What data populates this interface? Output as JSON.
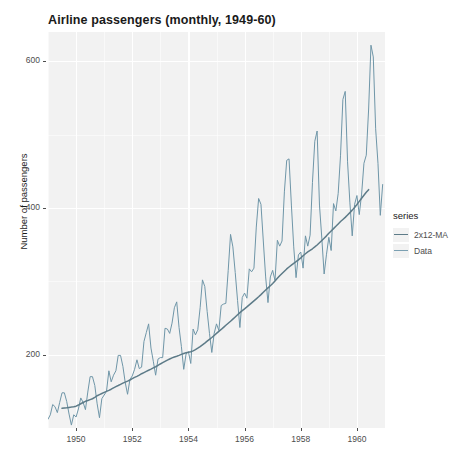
{
  "chart_data": {
    "type": "line",
    "title": "Airline passengers (monthly, 1949-60)",
    "xlabel": "",
    "ylabel": "Number of passengers",
    "xlim": [
      1949.0,
      1961.0
    ],
    "ylim": [
      100,
      640
    ],
    "xticks": [
      1950,
      1952,
      1954,
      1956,
      1958,
      1960
    ],
    "xticklabels": [
      "1950",
      "1952",
      "1954",
      "1956",
      "1958",
      "1960"
    ],
    "yticks": [
      200,
      400,
      600
    ],
    "yticklabels": [
      "200",
      "400",
      "600"
    ],
    "grid": true,
    "legend_title": "series",
    "legend_position": "right",
    "panel_background": "#f2f2f2",
    "grid_color": "#ffffff",
    "series": [
      {
        "name": "Data",
        "color": "#6f96a8",
        "x": [
          1949.0,
          1949.083,
          1949.167,
          1949.25,
          1949.333,
          1949.417,
          1949.5,
          1949.583,
          1949.667,
          1949.75,
          1949.833,
          1949.917,
          1950.0,
          1950.083,
          1950.167,
          1950.25,
          1950.333,
          1950.417,
          1950.5,
          1950.583,
          1950.667,
          1950.75,
          1950.833,
          1950.917,
          1951.0,
          1951.083,
          1951.167,
          1951.25,
          1951.333,
          1951.417,
          1951.5,
          1951.583,
          1951.667,
          1951.75,
          1951.833,
          1951.917,
          1952.0,
          1952.083,
          1952.167,
          1952.25,
          1952.333,
          1952.417,
          1952.5,
          1952.583,
          1952.667,
          1952.75,
          1952.833,
          1952.917,
          1953.0,
          1953.083,
          1953.167,
          1953.25,
          1953.333,
          1953.417,
          1953.5,
          1953.583,
          1953.667,
          1953.75,
          1953.833,
          1953.917,
          1954.0,
          1954.083,
          1954.167,
          1954.25,
          1954.333,
          1954.417,
          1954.5,
          1954.583,
          1954.667,
          1954.75,
          1954.833,
          1954.917,
          1955.0,
          1955.083,
          1955.167,
          1955.25,
          1955.333,
          1955.417,
          1955.5,
          1955.583,
          1955.667,
          1955.75,
          1955.833,
          1955.917,
          1956.0,
          1956.083,
          1956.167,
          1956.25,
          1956.333,
          1956.417,
          1956.5,
          1956.583,
          1956.667,
          1956.75,
          1956.833,
          1956.917,
          1957.0,
          1957.083,
          1957.167,
          1957.25,
          1957.333,
          1957.417,
          1957.5,
          1957.583,
          1957.667,
          1957.75,
          1957.833,
          1957.917,
          1958.0,
          1958.083,
          1958.167,
          1958.25,
          1958.333,
          1958.417,
          1958.5,
          1958.583,
          1958.667,
          1958.75,
          1958.833,
          1958.917,
          1959.0,
          1959.083,
          1959.167,
          1959.25,
          1959.333,
          1959.417,
          1959.5,
          1959.583,
          1959.667,
          1959.75,
          1959.833,
          1959.917,
          1960.0,
          1960.083,
          1960.167,
          1960.25,
          1960.333,
          1960.417,
          1960.5,
          1960.583,
          1960.667,
          1960.75,
          1960.833,
          1960.917
        ],
        "values": [
          112,
          118,
          132,
          129,
          121,
          135,
          148,
          148,
          136,
          119,
          104,
          118,
          115,
          126,
          141,
          135,
          125,
          149,
          170,
          170,
          158,
          133,
          114,
          140,
          145,
          150,
          178,
          163,
          172,
          178,
          199,
          199,
          184,
          162,
          146,
          166,
          171,
          180,
          193,
          181,
          183,
          218,
          230,
          242,
          209,
          191,
          172,
          194,
          196,
          196,
          236,
          235,
          229,
          243,
          264,
          272,
          237,
          211,
          180,
          201,
          204,
          188,
          235,
          227,
          234,
          264,
          302,
          293,
          259,
          229,
          203,
          229,
          242,
          233,
          267,
          269,
          270,
          315,
          364,
          347,
          312,
          274,
          237,
          278,
          284,
          277,
          317,
          313,
          318,
          374,
          413,
          405,
          355,
          306,
          271,
          306,
          315,
          301,
          356,
          348,
          355,
          422,
          465,
          467,
          404,
          347,
          305,
          336,
          340,
          318,
          362,
          348,
          363,
          435,
          491,
          505,
          404,
          359,
          310,
          337,
          360,
          342,
          406,
          396,
          420,
          472,
          548,
          559,
          463,
          407,
          362,
          405,
          417,
          391,
          419,
          461,
          472,
          535,
          622,
          606,
          508,
          461,
          390,
          432
        ]
      },
      {
        "name": "2x12-MA",
        "color": "#5d7b88",
        "x": [
          1949.5,
          1949.583,
          1949.667,
          1949.75,
          1949.833,
          1949.917,
          1950.0,
          1950.083,
          1950.167,
          1950.25,
          1950.333,
          1950.417,
          1950.5,
          1950.583,
          1950.667,
          1950.75,
          1950.833,
          1950.917,
          1951.0,
          1951.083,
          1951.167,
          1951.25,
          1951.333,
          1951.417,
          1951.5,
          1951.583,
          1951.667,
          1951.75,
          1951.833,
          1951.917,
          1952.0,
          1952.083,
          1952.167,
          1952.25,
          1952.333,
          1952.417,
          1952.5,
          1952.583,
          1952.667,
          1952.75,
          1952.833,
          1952.917,
          1953.0,
          1953.083,
          1953.167,
          1953.25,
          1953.333,
          1953.417,
          1953.5,
          1953.583,
          1953.667,
          1953.75,
          1953.833,
          1953.917,
          1954.0,
          1954.083,
          1954.167,
          1954.25,
          1954.333,
          1954.417,
          1954.5,
          1954.583,
          1954.667,
          1954.75,
          1954.833,
          1954.917,
          1955.0,
          1955.083,
          1955.167,
          1955.25,
          1955.333,
          1955.417,
          1955.5,
          1955.583,
          1955.667,
          1955.75,
          1955.833,
          1955.917,
          1956.0,
          1956.083,
          1956.167,
          1956.25,
          1956.333,
          1956.417,
          1956.5,
          1956.583,
          1956.667,
          1956.75,
          1956.833,
          1956.917,
          1957.0,
          1957.083,
          1957.167,
          1957.25,
          1957.333,
          1957.417,
          1957.5,
          1957.583,
          1957.667,
          1957.75,
          1957.833,
          1957.917,
          1958.0,
          1958.083,
          1958.167,
          1958.25,
          1958.333,
          1958.417,
          1958.5,
          1958.583,
          1958.667,
          1958.75,
          1958.833,
          1958.917,
          1959.0,
          1959.083,
          1959.167,
          1959.25,
          1959.333,
          1959.417,
          1959.5,
          1959.583,
          1959.667,
          1959.75,
          1959.833,
          1959.917,
          1960.0,
          1960.083,
          1960.167,
          1960.25,
          1960.333,
          1960.417
        ],
        "values": [
          126.8,
          127.3,
          127.6,
          128.1,
          128.5,
          129.0,
          129.8,
          131.3,
          133.1,
          134.8,
          136.4,
          137.5,
          138.7,
          139.9,
          141.8,
          144.0,
          145.6,
          147.1,
          148.5,
          149.9,
          151.3,
          152.9,
          154.7,
          156.4,
          157.9,
          159.5,
          161.2,
          162.6,
          163.9,
          165.4,
          167.2,
          169.0,
          170.4,
          172.1,
          174.0,
          175.6,
          177.2,
          178.8,
          180.3,
          181.9,
          183.5,
          185.4,
          187.3,
          189.1,
          190.9,
          192.6,
          194.1,
          195.6,
          196.8,
          197.9,
          199.1,
          200.4,
          201.6,
          202.6,
          203.3,
          204.0,
          205.2,
          206.8,
          208.8,
          211.0,
          213.4,
          215.8,
          218.4,
          220.9,
          223.4,
          226.2,
          229.0,
          231.7,
          234.4,
          237.2,
          240.1,
          242.8,
          245.5,
          248.4,
          251.4,
          254.4,
          257.3,
          260.0,
          262.5,
          265.1,
          267.9,
          270.7,
          273.4,
          276.1,
          278.9,
          281.9,
          285.1,
          288.2,
          291.1,
          294.0,
          297.1,
          300.5,
          304.1,
          307.6,
          310.7,
          313.8,
          316.9,
          319.6,
          322.2,
          324.6,
          326.8,
          329.3,
          332.0,
          334.9,
          337.6,
          340.1,
          342.2,
          344.4,
          346.9,
          349.6,
          352.6,
          355.7,
          358.8,
          362.0,
          365.5,
          368.7,
          371.9,
          375.0,
          378.3,
          381.5,
          384.4,
          387.2,
          390.4,
          393.7,
          397.1,
          400.8,
          404.8,
          409.0,
          413.2,
          417.4,
          421.4,
          425.0
        ]
      }
    ]
  },
  "legend": {
    "title": "series",
    "items": [
      {
        "label": "2x12-MA",
        "color": "#5d7b88"
      },
      {
        "label": "Data",
        "color": "#7ba0b2"
      }
    ]
  },
  "axes": {
    "y_title": "Number of passengers",
    "y_ticks": [
      "600",
      "400",
      "200"
    ],
    "x_ticks": [
      "1950",
      "1952",
      "1954",
      "1956",
      "1958",
      "1960"
    ]
  }
}
